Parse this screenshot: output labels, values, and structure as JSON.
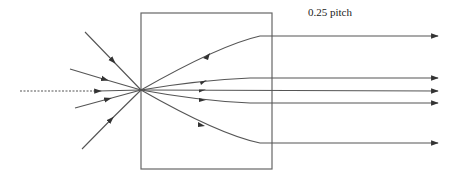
{
  "diagram": {
    "label": "0.25 pitch",
    "colors": {
      "line": "#555555",
      "box": "#666666",
      "background": "#ffffff"
    },
    "lens_box": {
      "x": 141,
      "y": 13,
      "width": 131,
      "height": 156
    },
    "focal_point": {
      "x": 141,
      "y": 90
    },
    "incoming_rays": [
      {
        "from": [
          85,
          32
        ],
        "style": "solid"
      },
      {
        "from": [
          70,
          69
        ],
        "style": "solid"
      },
      {
        "from": [
          20,
          91
        ],
        "style": "dotted"
      },
      {
        "from": [
          75,
          108
        ],
        "style": "solid"
      },
      {
        "from": [
          82,
          149
        ],
        "style": "solid"
      }
    ],
    "outgoing_rays": [
      {
        "exit_y": 36
      },
      {
        "exit_y": 78
      },
      {
        "exit_y": 91
      },
      {
        "exit_y": 103
      },
      {
        "exit_y": 143
      }
    ],
    "output_end_x": 438
  }
}
